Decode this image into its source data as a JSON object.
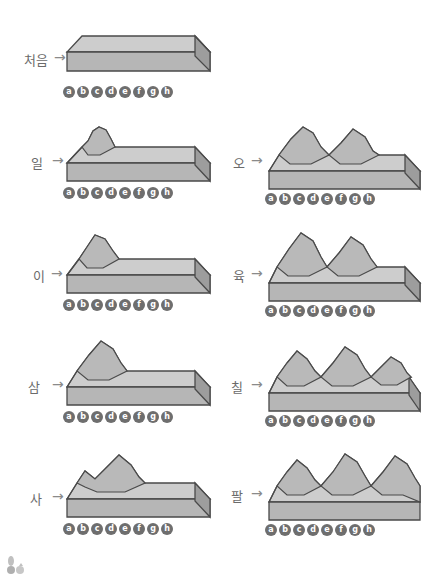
{
  "figure": {
    "title_visible": false,
    "background_color": "#ffffff",
    "block_top_color": "#bfbfbf",
    "block_front_color": "#b0b0b0",
    "block_side_color": "#9a9a9a",
    "block_face_light": "#cccccc",
    "block_outline_color": "#4a4a4a",
    "label_color": "#6b6b6b",
    "tick_circle_color": "#6e6e6e",
    "tick_text_color": "#ffffff"
  },
  "tick_labels": [
    "a",
    "b",
    "c",
    "d",
    "e",
    "f",
    "g",
    "h"
  ],
  "arrow_glyph": "→",
  "panels": [
    {
      "id": "panel-cheoeum",
      "label": "처음",
      "arrow": "→",
      "column": "left",
      "peaks": 0,
      "description": "flat undeformed block"
    },
    {
      "id": "panel-il",
      "label": "일",
      "arrow": "→",
      "column": "left",
      "peaks": 1,
      "description": "one small fold at left"
    },
    {
      "id": "panel-i",
      "label": "이",
      "arrow": "→",
      "column": "left",
      "peaks": 1,
      "description": "one fold, taller"
    },
    {
      "id": "panel-sam",
      "label": "삼",
      "arrow": "→",
      "column": "left",
      "peaks": 1,
      "description": "one fold, steeper"
    },
    {
      "id": "panel-sa",
      "label": "사",
      "arrow": "→",
      "column": "left",
      "peaks": 1,
      "description": "fold with second rise forming"
    },
    {
      "id": "panel-o",
      "label": "오",
      "arrow": "→",
      "column": "right",
      "peaks": 2,
      "description": "two folds"
    },
    {
      "id": "panel-yuk",
      "label": "육",
      "arrow": "→",
      "column": "right",
      "peaks": 2,
      "description": "two folds, taller"
    },
    {
      "id": "panel-chil",
      "label": "칠",
      "arrow": "→",
      "column": "right",
      "peaks": 3,
      "description": "three folds forming"
    },
    {
      "id": "panel-pal",
      "label": "팔",
      "arrow": "→",
      "column": "right",
      "peaks": 3,
      "description": "three full folds"
    }
  ]
}
